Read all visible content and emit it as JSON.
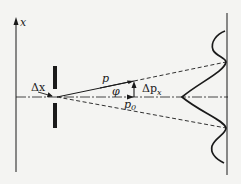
{
  "diagram": {
    "type": "single-slit electron diffraction",
    "labels": {
      "axis": "x",
      "slit_width": "Δx",
      "momentum": "p",
      "angle": "φ",
      "delta_p": "Δp",
      "delta_p_sub": "x",
      "p0": "p",
      "p0_sub": "0"
    },
    "colors": {
      "background": "#f4f4f2",
      "ink": "#1a1a1a"
    }
  }
}
